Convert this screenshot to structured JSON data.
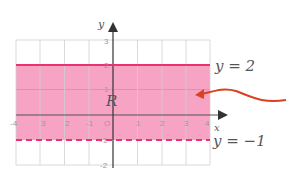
{
  "figure": {
    "axis_labels": {
      "x": "x",
      "y": "y"
    },
    "x_ticks": [
      "-4",
      "3",
      "2",
      "-1",
      "O",
      "1",
      "2",
      "3",
      "4"
    ],
    "y_ticks": [
      "3",
      "2",
      "1",
      "-1",
      "-2"
    ],
    "region_label": "R",
    "upper_boundary_label": "y = 2",
    "lower_boundary_label": "y = −1",
    "colors": {
      "region_fill": "#f59bbd",
      "solid_line": "#e8336e",
      "dashed_line": "#e8336e",
      "arrow": "#d9421e",
      "grid": "#cfcfcf",
      "axis": "#333333"
    },
    "region": {
      "description": "-1 < y <= 2",
      "lower": -1,
      "lower_style": "dashed",
      "upper": 2,
      "upper_style": "solid"
    }
  }
}
